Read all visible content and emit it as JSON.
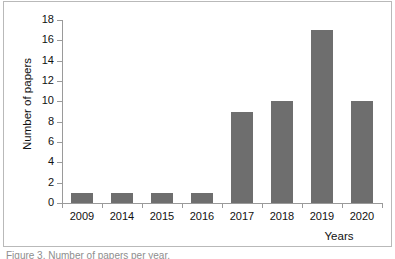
{
  "figure": {
    "caption": "Figure 3. Number of papers per year.",
    "background_color": "#ffffff",
    "frame_color": "#b9b9b9"
  },
  "chart_data": {
    "type": "bar",
    "title": "",
    "xlabel": "Years",
    "ylabel": "Number of papers",
    "categories": [
      "2009",
      "2014",
      "2015",
      "2016",
      "2017",
      "2018",
      "2019",
      "2020"
    ],
    "values": [
      1,
      1,
      1,
      1,
      9,
      10,
      17,
      10
    ],
    "ylim": [
      0,
      18
    ],
    "ytick_step": 2,
    "yticks": [
      "18",
      "16",
      "14",
      "12",
      "10",
      "8",
      "6",
      "4",
      "2",
      "0"
    ],
    "grid": false,
    "legend": false,
    "bar_color": "#6e6e6e",
    "axis_color": "#9a9a9a"
  }
}
